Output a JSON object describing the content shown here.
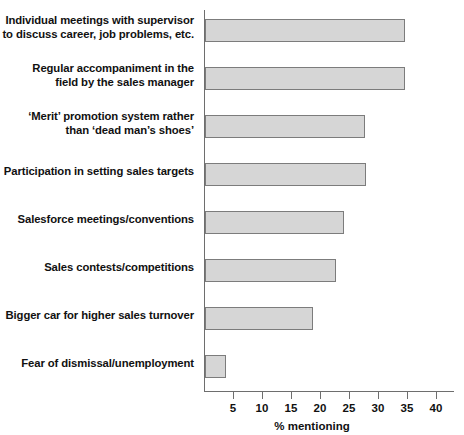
{
  "chart_data": {
    "type": "bar",
    "orientation": "horizontal",
    "title": "",
    "xlabel": "% mentioning",
    "ylabel": "",
    "xlim": [
      0,
      40
    ],
    "xticks": [
      5,
      10,
      15,
      20,
      25,
      30,
      35,
      40
    ],
    "xtick_labels": [
      "5",
      "10",
      "15",
      "20",
      "25",
      "30",
      "35",
      "40"
    ],
    "grid": false,
    "legend": null,
    "bar_fill_color": "#d6d6d6",
    "bar_border_color": "#7c7c7c",
    "axis_color": "#6e6e6e",
    "categories": [
      "Individual meetings with supervisor\nto discuss career, job problems, etc.",
      "Regular accompaniment in the\nfield by the sales manager",
      "‘Merit’ promotion system rather\nthan ‘dead man’s shoes’",
      "Participation in setting sales targets",
      "Salesforce meetings/conventions",
      "Sales contests/competitions",
      "Bigger car for higher sales turnover",
      "Fear of dismissal/unemployment"
    ],
    "values": [
      34.5,
      34.5,
      27.5,
      27.7,
      24,
      22.5,
      18.7,
      3.6
    ]
  }
}
